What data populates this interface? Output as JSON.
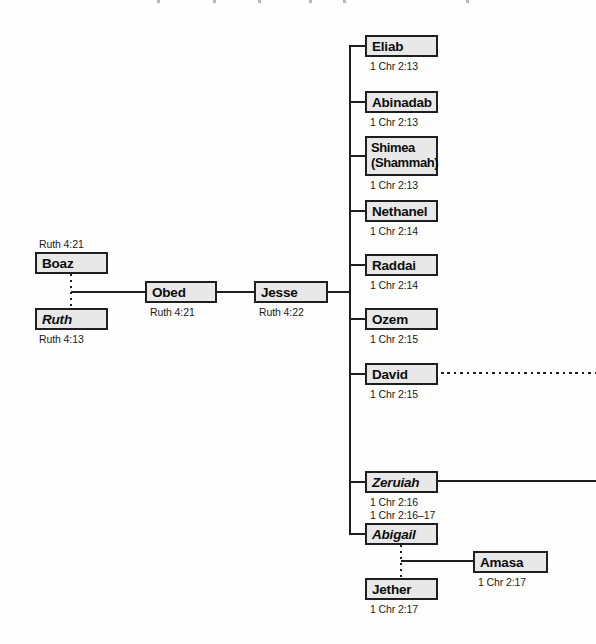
{
  "diagram": {
    "type": "genealogy-tree",
    "people": {
      "boaz": {
        "name": "Boaz",
        "ref": "Ruth 4:21"
      },
      "ruth": {
        "name": "Ruth",
        "ref": "Ruth 4:13"
      },
      "obed": {
        "name": "Obed",
        "ref": "Ruth 4:21"
      },
      "jesse": {
        "name": "Jesse",
        "ref": "Ruth 4:22"
      },
      "eliab": {
        "name": "Eliab",
        "ref": "1 Chr 2:13"
      },
      "abinadab": {
        "name": "Abinadab",
        "ref": "1 Chr 2:13"
      },
      "shimea": {
        "name": "Shimea (Shammah)",
        "ref": "1 Chr 2:13"
      },
      "nethanel": {
        "name": "Nethanel",
        "ref": "1 Chr 2:14"
      },
      "raddai": {
        "name": "Raddai",
        "ref": "1 Chr 2:14"
      },
      "ozem": {
        "name": "Ozem",
        "ref": "1 Chr 2:15"
      },
      "david": {
        "name": "David",
        "ref": "1 Chr 2:15"
      },
      "zeruiah": {
        "name": "Zeruiah",
        "ref": "1 Chr 2:16"
      },
      "abigail": {
        "name": "Abigail",
        "ref": "1 Chr 2:16–17"
      },
      "amasa": {
        "name": "Amasa",
        "ref": "1 Chr 2:17"
      },
      "jether": {
        "name": "Jether",
        "ref": "1 Chr 2:17"
      }
    },
    "line_styles": {
      "marriage": "dotted",
      "descent": "solid",
      "david_line_continues": "dotted",
      "zeruiah_line_continues": "solid"
    },
    "colors": {
      "box_fill": "#e8e8e8",
      "box_border": "#1f1f1f",
      "line": "#1f1f1f",
      "text": "#0d0d0d"
    }
  }
}
